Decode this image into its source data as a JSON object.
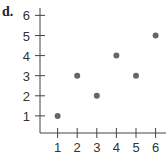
{
  "label": "d.",
  "chart_data": {
    "type": "scatter",
    "title": "",
    "xlabel": "",
    "ylabel": "",
    "x": [
      1,
      2,
      3,
      4,
      5,
      6
    ],
    "y": [
      1,
      3,
      2,
      4,
      3,
      5
    ],
    "xticks": [
      "1",
      "2",
      "3",
      "4",
      "5",
      "6"
    ],
    "yticks": [
      "1",
      "2",
      "3",
      "4",
      "5",
      "6"
    ],
    "xlim": [
      0,
      6.5
    ],
    "ylim": [
      0,
      6
    ],
    "grid": false,
    "point_color": "#666666",
    "axis_color": "#444444"
  }
}
